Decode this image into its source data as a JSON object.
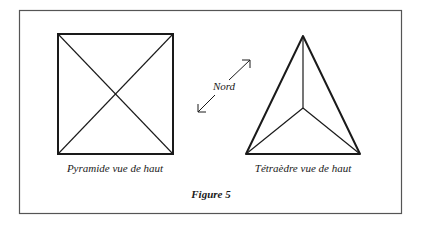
{
  "figure": {
    "caption": "Figure 5",
    "colors": {
      "ink": "#1a1a1a",
      "frame": "#555555",
      "background": "#ffffff"
    }
  },
  "pyramid": {
    "label": "Pyramide vue de haut"
  },
  "compass": {
    "label": "Nord"
  },
  "tetrahedron": {
    "label": "Tétraèdre vue de haut"
  }
}
